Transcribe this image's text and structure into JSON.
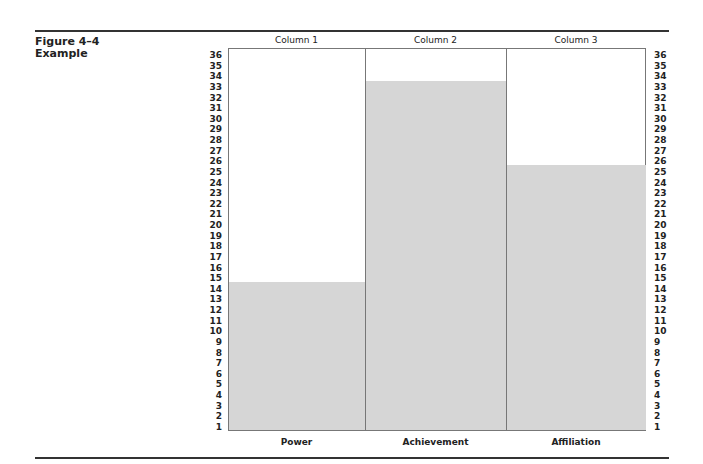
{
  "figure": {
    "label": "Figure 4–4",
    "caption": "Example"
  },
  "columns": [
    {
      "header": "Column 1",
      "category": "Power",
      "value": 14
    },
    {
      "header": "Column 2",
      "category": "Achievement",
      "value": 33
    },
    {
      "header": "Column 3",
      "category": "Affiliation",
      "value": 25
    }
  ],
  "axis": {
    "ticks": [
      "36",
      "35",
      "34",
      "33",
      "32",
      "31",
      "30",
      "29",
      "28",
      "27",
      "26",
      "25",
      "24",
      "23",
      "22",
      "21",
      "20",
      "19",
      "18",
      "17",
      "16",
      "15",
      "14",
      "13",
      "12",
      "11",
      "10",
      "9",
      "8",
      "7",
      "6",
      "5",
      "4",
      "3",
      "2",
      "1"
    ]
  },
  "colors": {
    "bar": "#d6d6d6",
    "border": "#777777"
  },
  "chart_data": {
    "type": "bar",
    "title": "Figure 4–4 Example",
    "categories": [
      "Power",
      "Achievement",
      "Affiliation"
    ],
    "column_headers": [
      "Column 1",
      "Column 2",
      "Column 3"
    ],
    "values": [
      14,
      33,
      25
    ],
    "xlabel": "",
    "ylabel": "",
    "ylim": [
      0,
      36
    ],
    "yticks": [
      1,
      2,
      3,
      4,
      5,
      6,
      7,
      8,
      9,
      10,
      11,
      12,
      13,
      14,
      15,
      16,
      17,
      18,
      19,
      20,
      21,
      22,
      23,
      24,
      25,
      26,
      27,
      28,
      29,
      30,
      31,
      32,
      33,
      34,
      35,
      36
    ],
    "y_axis_labels_both_sides": true,
    "grid": false,
    "legend": "none"
  }
}
